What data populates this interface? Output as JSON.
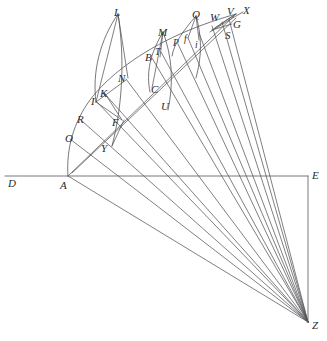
{
  "figure": {
    "background_color": "#ffffff",
    "line_color": "#56565a",
    "label_color": "#2b2b2b",
    "width": 327,
    "height": 341
  },
  "labels": [
    {
      "name": "point-label-L",
      "text": "L",
      "x": 114,
      "y": 7,
      "size": "normal"
    },
    {
      "name": "point-label-Q",
      "text": "Q",
      "x": 192,
      "y": 9,
      "size": "normal"
    },
    {
      "name": "point-label-W",
      "text": "W",
      "x": 210,
      "y": 12,
      "size": "normal"
    },
    {
      "name": "point-label-V",
      "text": "V",
      "x": 227,
      "y": 6,
      "size": "normal"
    },
    {
      "name": "point-label-X",
      "text": "X",
      "x": 243,
      "y": 5,
      "size": "normal"
    },
    {
      "name": "point-label-G",
      "text": "G",
      "x": 233,
      "y": 19,
      "size": "normal"
    },
    {
      "name": "point-label-S",
      "text": "S",
      "x": 225,
      "y": 30,
      "size": "normal"
    },
    {
      "name": "point-label-M",
      "text": "M",
      "x": 158,
      "y": 27,
      "size": "normal"
    },
    {
      "name": "point-label-T",
      "text": "T",
      "x": 155,
      "y": 48,
      "size": "small"
    },
    {
      "name": "point-label-B",
      "text": "B",
      "x": 145,
      "y": 52,
      "size": "normal"
    },
    {
      "name": "point-label-P",
      "text": "P",
      "x": 173,
      "y": 39,
      "size": "small"
    },
    {
      "name": "point-label-f",
      "text": "f",
      "x": 184,
      "y": 35,
      "size": "small"
    },
    {
      "name": "point-label-i",
      "text": "i",
      "x": 195,
      "y": 41,
      "size": "small"
    },
    {
      "name": "point-label-C",
      "text": "C",
      "x": 151,
      "y": 84,
      "size": "normal"
    },
    {
      "name": "point-label-U",
      "text": "U",
      "x": 161,
      "y": 101,
      "size": "normal"
    },
    {
      "name": "point-label-N",
      "text": "N",
      "x": 118,
      "y": 73,
      "size": "normal"
    },
    {
      "name": "point-label-K",
      "text": "K",
      "x": 100,
      "y": 88,
      "size": "normal"
    },
    {
      "name": "point-label-I",
      "text": "I",
      "x": 91,
      "y": 96,
      "size": "normal"
    },
    {
      "name": "point-label-F",
      "text": "F",
      "x": 112,
      "y": 117,
      "size": "normal"
    },
    {
      "name": "point-label-R",
      "text": "R",
      "x": 77,
      "y": 114,
      "size": "normal"
    },
    {
      "name": "point-label-O",
      "text": "O",
      "x": 65,
      "y": 133,
      "size": "normal"
    },
    {
      "name": "point-label-Y",
      "text": "Y",
      "x": 101,
      "y": 143,
      "size": "normal"
    },
    {
      "name": "point-label-D",
      "text": "D",
      "x": 8,
      "y": 178,
      "size": "normal"
    },
    {
      "name": "point-label-A",
      "text": "A",
      "x": 60,
      "y": 180,
      "size": "normal"
    },
    {
      "name": "point-label-E",
      "text": "E",
      "x": 312,
      "y": 170,
      "size": "normal"
    },
    {
      "name": "point-label-Z",
      "text": "Z",
      "x": 312,
      "y": 320,
      "size": "normal"
    }
  ],
  "geometry": {
    "apex_Z": {
      "x": 308,
      "y": 322
    },
    "origin_A": {
      "x": 68,
      "y": 176
    },
    "corner_E": {
      "x": 308,
      "y": 176
    },
    "baseline_left_D": {
      "x": 5,
      "y": 176
    },
    "arc_A_to_top": "A through O, R, I, N, B up to the upper-right cluster",
    "ray_count": 12
  }
}
